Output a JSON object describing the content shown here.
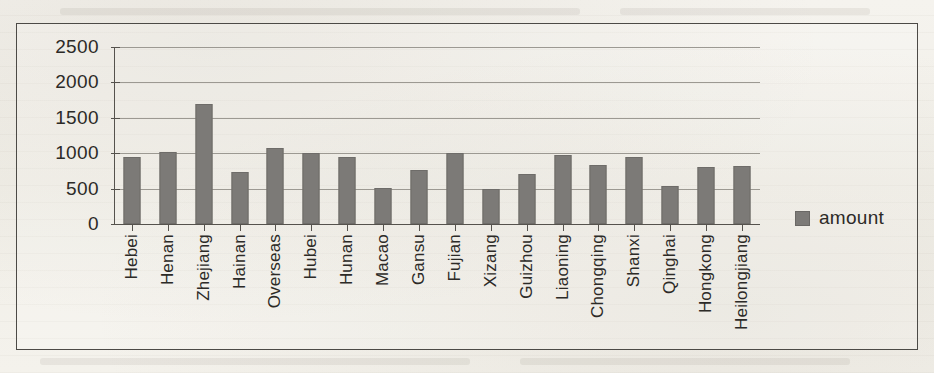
{
  "chart_data": {
    "type": "bar",
    "title": "",
    "subtitle": "",
    "xlabel": "",
    "ylabel": "",
    "grid": true,
    "legend_position": "right",
    "ylim": [
      0,
      2500
    ],
    "yticks": [
      2500,
      2000,
      1500,
      1000,
      500,
      0
    ],
    "ytick_labels": [
      "2500",
      "2000",
      "1500",
      "1000",
      "500",
      "0"
    ],
    "categories": [
      "Hebei",
      "Henan",
      "Zhejiang",
      "Hainan",
      "Overseas",
      "Hubei",
      "Hunan",
      "Macao",
      "Gansu",
      "Fujian",
      "Xizang",
      "Guizhou",
      "Liaoning",
      "Chongqing",
      "Shanxi",
      "Qinghai",
      "Hongkong",
      "Heilongjiang"
    ],
    "series": [
      {
        "name": "amount",
        "color": "#7c7a77",
        "values": [
          940,
          1020,
          1690,
          730,
          1080,
          1010,
          940,
          510,
          760,
          1000,
          490,
          710,
          975,
          840,
          940,
          530,
          810,
          820
        ]
      }
    ],
    "legend": [
      {
        "label": "amount",
        "color": "#7c7a77",
        "marker": "square"
      }
    ]
  },
  "colors": {
    "bar": "#7c7a77",
    "axis": "#55524d",
    "gridline": "#9c9992",
    "frame": "#4c4a46",
    "text": "#2c2a27",
    "page_background": "#f3f1ec"
  }
}
